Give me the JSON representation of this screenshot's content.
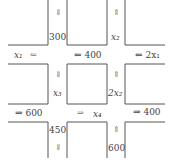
{
  "diagram": {
    "type": "traffic-network",
    "line_color": "#555555",
    "labels": {
      "top_left_down_arrow": "⇓",
      "top_left_flow": "300",
      "top_right_up_arrow": "⇑",
      "top_right_flow": "x₂",
      "upper_left_var": "x₁",
      "upper_left_arrow": "⇐",
      "upper_mid_flow": "⇐ 400",
      "upper_right_flow": "⇐ 2x₁",
      "mid_left_down_arrow": "⇓",
      "mid_left_var": "x₃",
      "mid_right_up_arrow": "⇑",
      "mid_right_var": "2x₂",
      "lower_left_flow": "⇒ 600",
      "lower_mid_arrow": "⇒",
      "lower_mid_var": "x₄",
      "lower_right_flow": "⇒ 400",
      "bottom_left_flow": "450",
      "bottom_left_down_arrow": "⇓",
      "bottom_right_up_arrow": "⇑",
      "bottom_right_flow": "600"
    }
  }
}
